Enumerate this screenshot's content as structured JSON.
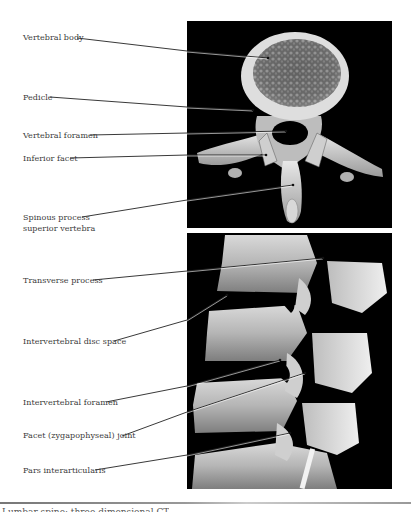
{
  "figure": {
    "top_panel": {
      "description": "3D CT reconstruction, axial view of lumbar vertebra",
      "labels": [
        {
          "text": "Vertebral body",
          "x": 23,
          "y": 32
        },
        {
          "text": "Pedicle",
          "x": 23,
          "y": 93
        },
        {
          "text": "Vertebral foramen",
          "x": 23,
          "y": 130
        },
        {
          "text": "Inferior facet",
          "x": 23,
          "y": 154
        },
        {
          "text": "Spinous process",
          "x": 23,
          "y": 213
        },
        {
          "text": "superior vertebra",
          "x": 23,
          "y": 224
        }
      ]
    },
    "bottom_panel": {
      "description": "3D CT reconstruction, lateral view of lumbar spine",
      "labels": [
        {
          "text": "Transverse process",
          "x": 23,
          "y": 275
        },
        {
          "text": "Intervertebral disc space",
          "x": 23,
          "y": 336
        },
        {
          "text": "Intervertebral foramen",
          "x": 23,
          "y": 397
        },
        {
          "text": "Facet (zygapophyseal) joint",
          "x": 23,
          "y": 430
        },
        {
          "text": "Pars interarticularis",
          "x": 23,
          "y": 465
        }
      ]
    },
    "caption": "Lumbar spine: three-dimensional CT"
  },
  "colors": {
    "background": "#ffffff",
    "panel": "#000000",
    "label_text": "#3a3a3a",
    "leader_line": "#222222"
  }
}
